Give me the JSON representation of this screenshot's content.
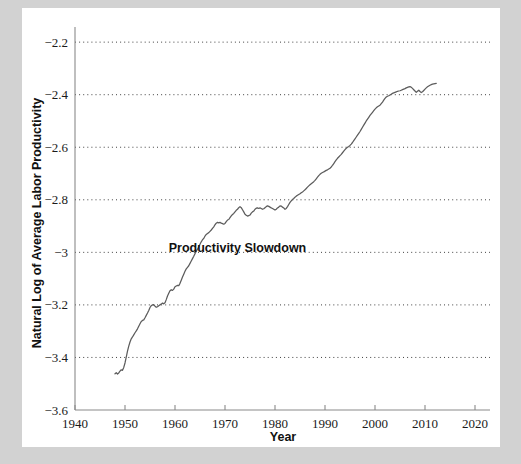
{
  "figure": {
    "background_color": "#d2d2d2",
    "panel_color": "#ffffff",
    "line_color": "#5c5c5c",
    "grid_color": "#2b2b2b"
  },
  "chart_data": {
    "type": "line",
    "title": "",
    "xlabel": "Year",
    "ylabel": "Natural Log of Average Labor Productivity",
    "xlim": [
      1940,
      2023
    ],
    "ylim": [
      -3.6,
      -2.15
    ],
    "grid": "horizontal-dotted",
    "legend": "none",
    "xticks": [
      1940,
      1950,
      1960,
      1970,
      1980,
      1990,
      2000,
      2010,
      2020
    ],
    "xtick_labels": [
      "1940",
      "1950",
      "1960",
      "1970",
      "1980",
      "1990",
      "2000",
      "2010",
      "2020"
    ],
    "yticks": [
      -2.2,
      -2.4,
      -2.6,
      -2.8,
      -3,
      -3.2,
      -3.4,
      -3.6
    ],
    "ytick_labels": [
      "−2.2",
      "−2.4",
      "−2.6",
      "−2.8",
      "−3",
      "−3.2",
      "−3.4",
      "−3.6"
    ],
    "annotations": [
      {
        "text": "Productivity Slowdown",
        "x": 1972.5,
        "y": -2.985
      }
    ],
    "series": [
      {
        "name": "Natural Log of Average Labor Productivity",
        "x": [
          1948.0,
          1948.25,
          1948.5,
          1948.75,
          1949.0,
          1949.25,
          1949.5,
          1949.75,
          1950.0,
          1950.25,
          1950.5,
          1950.75,
          1951.0,
          1951.25,
          1951.5,
          1951.75,
          1952.0,
          1952.25,
          1952.5,
          1952.75,
          1953.0,
          1953.25,
          1953.5,
          1953.75,
          1954.0,
          1954.25,
          1954.5,
          1954.75,
          1955.0,
          1955.25,
          1955.5,
          1955.75,
          1956.0,
          1956.25,
          1956.5,
          1956.75,
          1957.0,
          1957.25,
          1957.5,
          1957.75,
          1958.0,
          1958.25,
          1958.5,
          1958.75,
          1959.0,
          1959.25,
          1959.5,
          1959.75,
          1960.0,
          1960.25,
          1960.5,
          1960.75,
          1961.0,
          1961.25,
          1961.5,
          1961.75,
          1962.0,
          1962.25,
          1962.5,
          1962.75,
          1963.0,
          1963.25,
          1963.5,
          1963.75,
          1964.0,
          1964.25,
          1964.5,
          1964.75,
          1965.0,
          1965.25,
          1965.5,
          1965.75,
          1966.0,
          1966.25,
          1966.5,
          1966.75,
          1967.0,
          1967.25,
          1967.5,
          1967.75,
          1968.0,
          1968.25,
          1968.5,
          1968.75,
          1969.0,
          1969.25,
          1969.5,
          1969.75,
          1970.0,
          1970.25,
          1970.5,
          1970.75,
          1971.0,
          1971.25,
          1971.5,
          1971.75,
          1972.0,
          1972.25,
          1972.5,
          1972.75,
          1973.0,
          1973.25,
          1973.5,
          1973.75,
          1974.0,
          1974.25,
          1974.5,
          1974.75,
          1975.0,
          1975.25,
          1975.5,
          1975.75,
          1976.0,
          1976.25,
          1976.5,
          1976.75,
          1977.0,
          1977.25,
          1977.5,
          1977.75,
          1978.0,
          1978.25,
          1978.5,
          1978.75,
          1979.0,
          1979.25,
          1979.5,
          1979.75,
          1980.0,
          1980.25,
          1980.5,
          1980.75,
          1981.0,
          1981.25,
          1981.5,
          1981.75,
          1982.0,
          1982.25,
          1982.5,
          1982.75,
          1983.0,
          1983.25,
          1983.5,
          1983.75,
          1984.0,
          1984.25,
          1984.5,
          1984.75,
          1985.0,
          1985.25,
          1985.5,
          1985.75,
          1986.0,
          1986.25,
          1986.5,
          1986.75,
          1987.0,
          1987.25,
          1987.5,
          1987.75,
          1988.0,
          1988.25,
          1988.5,
          1988.75,
          1989.0,
          1989.25,
          1989.5,
          1989.75,
          1990.0,
          1990.25,
          1990.5,
          1990.75,
          1991.0,
          1991.25,
          1991.5,
          1991.75,
          1992.0,
          1992.25,
          1992.5,
          1992.75,
          1993.0,
          1993.25,
          1993.5,
          1993.75,
          1994.0,
          1994.25,
          1994.5,
          1994.75,
          1995.0,
          1995.25,
          1995.5,
          1995.75,
          1996.0,
          1996.25,
          1996.5,
          1996.75,
          1997.0,
          1997.25,
          1997.5,
          1997.75,
          1998.0,
          1998.25,
          1998.5,
          1998.75,
          1999.0,
          1999.25,
          1999.5,
          1999.75,
          2000.0,
          2000.25,
          2000.5,
          2000.75,
          2001.0,
          2001.25,
          2001.5,
          2001.75,
          2002.0,
          2002.25,
          2002.5,
          2002.75,
          2003.0,
          2003.25,
          2003.5,
          2003.75,
          2004.0,
          2004.25,
          2004.5,
          2004.75,
          2005.0,
          2005.25,
          2005.5,
          2005.75,
          2006.0,
          2006.25,
          2006.5,
          2006.75,
          2007.0,
          2007.25,
          2007.5,
          2007.75,
          2008.0,
          2008.25,
          2008.5,
          2008.75,
          2009.0,
          2009.25,
          2009.5,
          2009.75,
          2010.0,
          2010.25,
          2010.5,
          2010.75,
          2011.0,
          2011.25,
          2011.5,
          2011.75,
          2012.0,
          2012.25
        ],
        "y": [
          -3.462,
          -3.458,
          -3.463,
          -3.459,
          -3.452,
          -3.447,
          -3.449,
          -3.438,
          -3.421,
          -3.399,
          -3.376,
          -3.357,
          -3.341,
          -3.329,
          -3.322,
          -3.314,
          -3.306,
          -3.299,
          -3.291,
          -3.281,
          -3.272,
          -3.263,
          -3.259,
          -3.257,
          -3.249,
          -3.24,
          -3.231,
          -3.221,
          -3.21,
          -3.203,
          -3.2,
          -3.199,
          -3.205,
          -3.209,
          -3.207,
          -3.203,
          -3.2,
          -3.197,
          -3.193,
          -3.196,
          -3.192,
          -3.18,
          -3.166,
          -3.156,
          -3.146,
          -3.142,
          -3.145,
          -3.14,
          -3.131,
          -3.128,
          -3.126,
          -3.127,
          -3.118,
          -3.106,
          -3.094,
          -3.083,
          -3.072,
          -3.063,
          -3.057,
          -3.051,
          -3.042,
          -3.033,
          -3.024,
          -3.015,
          -3.005,
          -2.996,
          -2.988,
          -2.979,
          -2.969,
          -2.96,
          -2.952,
          -2.947,
          -2.938,
          -2.932,
          -2.928,
          -2.925,
          -2.92,
          -2.915,
          -2.909,
          -2.903,
          -2.895,
          -2.889,
          -2.886,
          -2.888,
          -2.886,
          -2.889,
          -2.891,
          -2.893,
          -2.89,
          -2.883,
          -2.877,
          -2.875,
          -2.868,
          -2.861,
          -2.856,
          -2.852,
          -2.846,
          -2.84,
          -2.836,
          -2.83,
          -2.826,
          -2.83,
          -2.838,
          -2.846,
          -2.855,
          -2.859,
          -2.862,
          -2.86,
          -2.858,
          -2.851,
          -2.846,
          -2.843,
          -2.836,
          -2.832,
          -2.831,
          -2.833,
          -2.831,
          -2.833,
          -2.836,
          -2.834,
          -2.83,
          -2.826,
          -2.823,
          -2.825,
          -2.828,
          -2.831,
          -2.833,
          -2.836,
          -2.839,
          -2.836,
          -2.831,
          -2.828,
          -2.823,
          -2.824,
          -2.828,
          -2.831,
          -2.836,
          -2.833,
          -2.826,
          -2.818,
          -2.81,
          -2.804,
          -2.799,
          -2.795,
          -2.79,
          -2.786,
          -2.783,
          -2.78,
          -2.777,
          -2.773,
          -2.77,
          -2.766,
          -2.762,
          -2.757,
          -2.752,
          -2.747,
          -2.743,
          -2.739,
          -2.735,
          -2.731,
          -2.726,
          -2.72,
          -2.714,
          -2.708,
          -2.703,
          -2.699,
          -2.696,
          -2.694,
          -2.691,
          -2.688,
          -2.686,
          -2.683,
          -2.68,
          -2.675,
          -2.669,
          -2.662,
          -2.655,
          -2.648,
          -2.642,
          -2.637,
          -2.632,
          -2.627,
          -2.621,
          -2.615,
          -2.609,
          -2.604,
          -2.6,
          -2.597,
          -2.593,
          -2.588,
          -2.582,
          -2.575,
          -2.568,
          -2.561,
          -2.554,
          -2.547,
          -2.54,
          -2.532,
          -2.524,
          -2.516,
          -2.508,
          -2.5,
          -2.493,
          -2.486,
          -2.479,
          -2.473,
          -2.467,
          -2.461,
          -2.455,
          -2.45,
          -2.446,
          -2.443,
          -2.44,
          -2.434,
          -2.428,
          -2.421,
          -2.414,
          -2.409,
          -2.406,
          -2.404,
          -2.401,
          -2.398,
          -2.395,
          -2.393,
          -2.391,
          -2.389,
          -2.387,
          -2.386,
          -2.385,
          -2.383,
          -2.381,
          -2.379,
          -2.377,
          -2.374,
          -2.372,
          -2.37,
          -2.369,
          -2.372,
          -2.376,
          -2.381,
          -2.386,
          -2.391,
          -2.387,
          -2.383,
          -2.388,
          -2.392,
          -2.389,
          -2.384,
          -2.379,
          -2.374,
          -2.37,
          -2.367,
          -2.364,
          -2.362,
          -2.36,
          -2.359,
          -2.358,
          -2.357
        ]
      }
    ]
  },
  "axis_titles": {
    "x": "Year",
    "y": "Natural Log of Average Labor Productivity"
  }
}
